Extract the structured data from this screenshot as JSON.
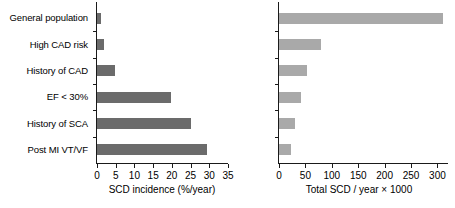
{
  "chart_data": {
    "type": "bar",
    "title": "",
    "orientation": "horizontal",
    "grid": false,
    "legend": null,
    "categories": [
      "General population",
      "High CAD risk",
      "History of CAD",
      "EF < 30%",
      "History of SCA",
      "Post MI VT/VF"
    ],
    "panels": [
      {
        "name": "scd-incidence",
        "xlabel": "SCD incidence (%/year)",
        "ylabel": "",
        "xlim": [
          0,
          35
        ],
        "xticks": [
          0,
          5,
          10,
          15,
          20,
          25,
          30,
          35
        ],
        "xticklabels": [
          "0",
          "5",
          "10",
          "15",
          "20",
          "25",
          "30",
          "35"
        ],
        "bar_color": "#6b6b6b",
        "values": [
          1,
          1.8,
          4.7,
          19.8,
          25.2,
          29.5
        ]
      },
      {
        "name": "total-scd",
        "xlabel": "Total SCD / year × 1000",
        "ylabel": "",
        "xlim": [
          0,
          320
        ],
        "xticks": [
          0,
          50,
          100,
          150,
          200,
          250,
          300
        ],
        "xticklabels": [
          "0",
          "50",
          "100",
          "150",
          "200",
          "250",
          "300"
        ],
        "bar_color": "#a9a9a9",
        "values": [
          310,
          80,
          53,
          42,
          30,
          23
        ]
      }
    ]
  }
}
